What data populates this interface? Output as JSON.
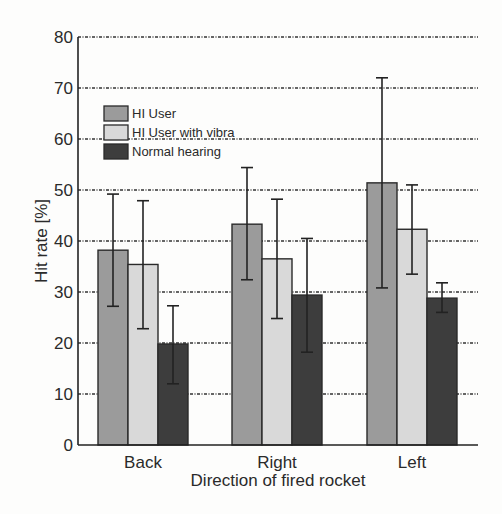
{
  "chart_data": {
    "type": "bar",
    "title": "",
    "xlabel": "Direction of fired rocket",
    "ylabel": "Hit rate [%]",
    "ylim": [
      0,
      80
    ],
    "yticks": [
      0,
      10,
      20,
      30,
      40,
      50,
      60,
      70,
      80
    ],
    "grid": "horizontal dashed",
    "legend_position": "upper left",
    "categories": [
      "Back",
      "Right",
      "Left"
    ],
    "series": [
      {
        "name": "HI User",
        "color": "#9b9b9b",
        "values": [
          38.2,
          43.3,
          51.4
        ],
        "err_low": [
          27.2,
          32.4,
          30.8
        ],
        "err_high": [
          49.2,
          54.4,
          72.0
        ]
      },
      {
        "name": "HI User with vibra",
        "color": "#d9d9d9",
        "values": [
          35.4,
          36.5,
          42.3
        ],
        "err_low": [
          22.8,
          24.8,
          33.5
        ],
        "err_high": [
          47.9,
          48.2,
          51.0
        ]
      },
      {
        "name": "Normal hearing",
        "color": "#3d3d3d",
        "values": [
          19.8,
          29.4,
          28.8
        ],
        "err_low": [
          12.0,
          18.2,
          26.0
        ],
        "err_high": [
          27.3,
          40.5,
          31.8
        ]
      }
    ]
  }
}
